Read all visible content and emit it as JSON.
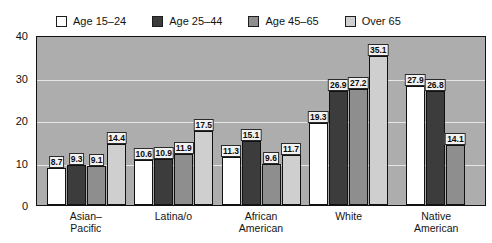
{
  "chart_data": {
    "type": "bar",
    "title": "",
    "subtitle": "",
    "xlabel": "",
    "ylabel": "",
    "ylim": [
      0,
      40
    ],
    "yticks": [
      0,
      10,
      20,
      30,
      40
    ],
    "grid": true,
    "legend_position": "top-left",
    "categories": [
      "Asian–\nPacific",
      "Latina/o",
      "African\nAmerican",
      "White",
      "Native\nAmerican"
    ],
    "series": [
      {
        "name": "Age 15–24",
        "color": "#ffffff",
        "values": [
          8.7,
          10.6,
          11.3,
          19.3,
          27.9
        ]
      },
      {
        "name": "Age 25–44",
        "color": "#3c3c3c",
        "values": [
          9.3,
          10.9,
          15.1,
          26.9,
          26.8
        ]
      },
      {
        "name": "Age 45–65",
        "color": "#8e8e8e",
        "values": [
          9.1,
          11.9,
          9.6,
          27.2,
          14.1
        ]
      },
      {
        "name": "Over 65",
        "color": "#cfcfcf",
        "values": [
          14.4,
          17.5,
          11.7,
          35.1,
          null
        ]
      }
    ]
  },
  "legend": {
    "items": [
      {
        "label": "Age 15–24",
        "color": "#ffffff"
      },
      {
        "label": "Age 25–44",
        "color": "#3c3c3c"
      },
      {
        "label": "Age 45–65",
        "color": "#8e8e8e"
      },
      {
        "label": "Over 65",
        "color": "#cfcfcf"
      }
    ]
  },
  "axes": {
    "y_ticks": [
      "0",
      "10",
      "20",
      "30",
      "40"
    ]
  },
  "colors": {
    "plot_background": "#adadad",
    "gridline": "#e6e6e6",
    "frame": "#111111",
    "text": "#121212"
  }
}
